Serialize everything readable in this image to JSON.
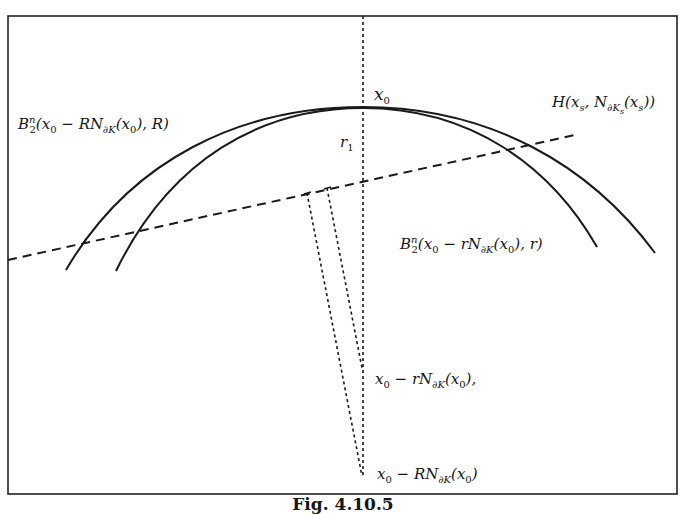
{
  "figure": {
    "caption": "Fig. 4.10.5",
    "frame": {
      "x": 8,
      "y": 16,
      "width": 669,
      "height": 478,
      "stroke": "#222222"
    },
    "stroke_color": "#1a1a1a",
    "background": "#ffffff"
  },
  "labels": {
    "apex_point": {
      "main": "x",
      "sub": "0"
    },
    "r1": {
      "main": "r",
      "sub": "1"
    },
    "big_ball": {
      "prefix": "B",
      "sup": "n",
      "sub": "2",
      "body_1": "(x",
      "body_1_sub": "0",
      "body_2": " − RN",
      "body_2_sub": "∂K",
      "body_3": "(x",
      "body_3_sub": "0",
      "body_4": "), R)"
    },
    "small_ball": {
      "prefix": "B",
      "sup": "n",
      "sub": "2",
      "body_1": "(x",
      "body_1_sub": "0",
      "body_2": " − rN",
      "body_2_sub": "∂K",
      "body_3": "(x",
      "body_3_sub": "0",
      "body_4": "), r)"
    },
    "hyperplane": {
      "body_1": "H(x",
      "body_1_sub": "s",
      "body_2": ", N",
      "body_2_sub": "∂K",
      "body_2_subsub": "s",
      "body_3": "(x",
      "body_3_sub": "s",
      "body_4": "))"
    },
    "small_center": {
      "body_1": "x",
      "body_1_sub": "0",
      "body_2": " − rN",
      "body_2_sub": "∂K",
      "body_3": "(x",
      "body_3_sub": "0",
      "body_4": "),"
    },
    "big_center": {
      "body_1": "x",
      "body_1_sub": "0",
      "body_2": " − RN",
      "body_2_sub": "∂K",
      "body_3": "(x",
      "body_3_sub": "0",
      "body_4": ")"
    }
  },
  "geometry": {
    "apex": {
      "x": 363,
      "y": 107
    },
    "outer_arc_R": {
      "start": [
        66,
        270
      ],
      "apex": [
        363,
        107
      ],
      "end": [
        655,
        253
      ]
    },
    "inner_arc_r": {
      "start": [
        116,
        271
      ],
      "apex": [
        363,
        107
      ],
      "end": [
        597,
        247
      ]
    },
    "normal_axis": {
      "x": 363,
      "y_top": 16,
      "y_bottom": 476
    },
    "hyperplane_line": {
      "start": [
        8,
        260
      ],
      "end": [
        575,
        135
      ]
    },
    "dotted_to_big_center": {
      "start": [
        307,
        193
      ],
      "end": [
        362,
        476
      ]
    },
    "dotted_to_small_center": {
      "start": [
        327,
        188
      ],
      "end": [
        362,
        368
      ]
    },
    "small_center_point": {
      "x": 363,
      "y": 368
    },
    "big_center_point": {
      "x": 363,
      "y": 476
    }
  }
}
